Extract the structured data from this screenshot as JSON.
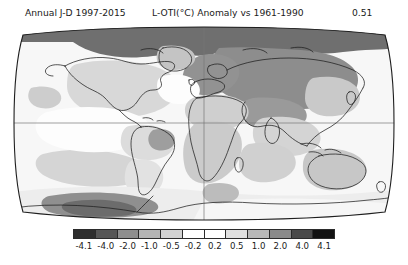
{
  "header": {
    "period_label": "Annual J-D 1997-2015",
    "variable_label": "L-OTI(°C) Anomaly vs 1961-1990",
    "global_mean": "0.51"
  },
  "colorbar": {
    "orientation": "horizontal",
    "tick_labels": [
      "-4.1",
      "-4.0",
      "-2.0",
      "-1.0",
      "-0.5",
      "-0.2",
      "0.2",
      "0.5",
      "1.0",
      "2.0",
      "4.0",
      "4.1"
    ],
    "bin_colors": [
      "#2e2e2e",
      "#565656",
      "#8e8e8e",
      "#b4b4b4",
      "#d2d2d2",
      "#ffffff",
      "#ffffff",
      "#e0e0e0",
      "#b8b8b8",
      "#8a8a8a",
      "#4a4a4a",
      "#121212"
    ],
    "outline_color": "#2b2b2b"
  },
  "chart_data": {
    "type": "heatmap",
    "title": "L-OTI(°C) Anomaly vs 1961-1990",
    "subtitle": "Annual J-D 1997-2015",
    "annotation_global_mean": "0.51",
    "units": "°C",
    "projection": "robinson",
    "colormap": "grayscale-discrete",
    "grid": true,
    "legend_position": "bottom",
    "xlabel": "",
    "ylabel": "",
    "colorbar_bounds": [
      -4.1,
      -4.0,
      -2.0,
      -1.0,
      -0.5,
      -0.2,
      0.2,
      0.5,
      1.0,
      2.0,
      4.0,
      4.1
    ],
    "graticule": {
      "meridians_deg": [
        0
      ],
      "parallels_deg": [
        0
      ]
    },
    "regions": [
      {
        "name": "Arctic Ocean / high Arctic",
        "anomaly_bin": "2.0 to 4.0",
        "shade": "#6d6d6d"
      },
      {
        "name": "Northern Canada / Greenland",
        "anomaly_bin": "1.0 to 2.0",
        "shade": "#8d8d8d"
      },
      {
        "name": "Siberia / northern Asia",
        "anomaly_bin": "1.0 to 2.0",
        "shade": "#8d8d8d"
      },
      {
        "name": "Europe",
        "anomaly_bin": "0.5 to 1.0",
        "shade": "#bdbdbd"
      },
      {
        "name": "North America (mid-latitudes)",
        "anomaly_bin": "0.2 to 0.5",
        "shade": "#dedede"
      },
      {
        "name": "Central Asia",
        "anomaly_bin": "0.5 to 1.0",
        "shade": "#bdbdbd"
      },
      {
        "name": "Africa",
        "anomaly_bin": "0.5 to 1.0",
        "shade": "#c6c6c6"
      },
      {
        "name": "South America",
        "anomaly_bin": "0.2 to 0.5",
        "shade": "#dcdcdc"
      },
      {
        "name": "Australia",
        "anomaly_bin": "0.5 to 1.0",
        "shade": "#c8c8c8"
      },
      {
        "name": "North Atlantic (subpolar)",
        "anomaly_bin": "-0.2 to 0.2",
        "shade": "#fbfbfb"
      },
      {
        "name": "Eastern Pacific",
        "anomaly_bin": "-0.2 to 0.2",
        "shade": "#fafafa"
      },
      {
        "name": "Southern Ocean",
        "anomaly_bin": "0.2 to 0.5",
        "shade": "#e8e8e8"
      },
      {
        "name": "Antarctic Peninsula / West Antarctica",
        "anomaly_bin": "1.0 to 2.0",
        "shade": "#8f8f8f"
      },
      {
        "name": "East Antarctica",
        "anomaly_bin": "-0.2 to 0.2",
        "shade": "#f4f4f4"
      }
    ]
  }
}
